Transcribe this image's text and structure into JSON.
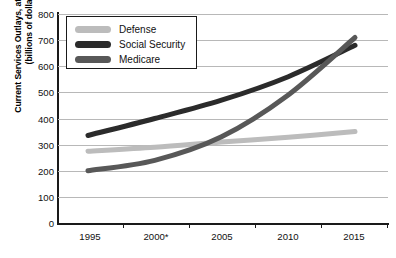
{
  "chart_data": {
    "type": "line",
    "title": "",
    "xlabel": "",
    "ylabel": "Current Services Outlays, at Current Rates (billions of dollars)",
    "ylabel_line1": "Current Services Outlays, at Current Rates",
    "ylabel_line2": "(billions of dollars)",
    "x": [
      1995,
      2000,
      2005,
      2010,
      2015
    ],
    "xtick_labels": [
      "1995",
      "2000*",
      "2005",
      "2010",
      "2015"
    ],
    "xlim": [
      1995,
      2015
    ],
    "ylim": [
      0,
      800
    ],
    "ytick_labels": [
      "0",
      "100",
      "200",
      "300",
      "400",
      "500",
      "600",
      "700",
      "800"
    ],
    "ytick_values": [
      0,
      100,
      200,
      300,
      400,
      500,
      600,
      700,
      800
    ],
    "grid": true,
    "grid_axis": "y",
    "legend_position": "upper-left-inside",
    "series": [
      {
        "name": "Defense",
        "color": "#bcbcbc",
        "values": [
          275,
          290,
          310,
          328,
          350
        ],
        "x": [
          1995,
          2000,
          2005,
          2010,
          2015
        ]
      },
      {
        "name": "Social Security",
        "color": "#2b2b2b",
        "values": [
          335,
          400,
          470,
          560,
          680
        ],
        "x": [
          1995,
          2000,
          2005,
          2010,
          2015
        ]
      },
      {
        "name": "Medicare",
        "color": "#585858",
        "values": [
          200,
          240,
          330,
          490,
          710
        ],
        "x": [
          1995,
          2000,
          2005,
          2010,
          2015
        ]
      }
    ],
    "footnote_marker": "*"
  },
  "legend": {
    "items": [
      {
        "label": "Defense"
      },
      {
        "label": "Social Security"
      },
      {
        "label": "Medicare"
      }
    ]
  },
  "axis": {
    "y_tick_0": "0",
    "y_tick_1": "100",
    "y_tick_2": "200",
    "y_tick_3": "300",
    "y_tick_4": "400",
    "y_tick_5": "500",
    "y_tick_6": "600",
    "y_tick_7": "700",
    "y_tick_8": "800",
    "x_tick_0": "1995",
    "x_tick_1": "2000*",
    "x_tick_2": "2005",
    "x_tick_3": "2010",
    "x_tick_4": "2015"
  }
}
